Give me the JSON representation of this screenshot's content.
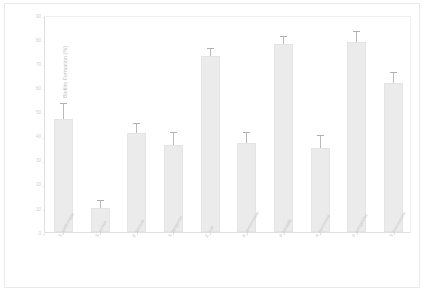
{
  "chart_data": {
    "type": "bar",
    "title": "",
    "xlabel": "",
    "ylabel": "Biofilm Formation (%)",
    "ylim": [
      0,
      90
    ],
    "ytick_labels": [
      "90",
      "80",
      "70",
      "60",
      "50",
      "40",
      "30",
      "20",
      "10",
      "0"
    ],
    "ytick_values": [
      90,
      80,
      70,
      60,
      50,
      40,
      30,
      20,
      10,
      0
    ],
    "grid": false,
    "legend": "none",
    "bar_color": "#ebebeb",
    "error_color": "#b9b9b9",
    "categories": [
      "S. epidermidis",
      "S. aureus",
      "E. faecalis",
      "S. pyogenes",
      "E. coli",
      "K. pneumoniae",
      "P. mirabilis",
      "A. baumannii",
      "P. aeruginosa",
      "S. marcescens"
    ],
    "values": [
      47,
      10,
      41,
      36,
      73,
      37,
      78,
      35,
      79,
      62
    ],
    "errors": [
      6,
      3,
      4,
      5,
      3,
      4,
      3,
      5,
      4,
      4
    ]
  },
  "axis": {
    "y_title": "Biofilm Formation (%)"
  }
}
